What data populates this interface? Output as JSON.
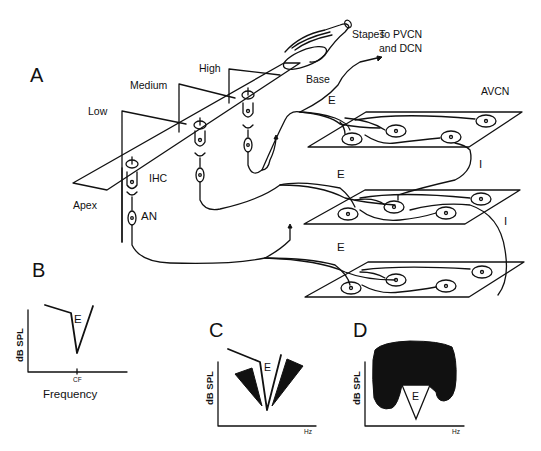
{
  "panels": {
    "A": {
      "label": "A",
      "cochlea": {
        "stapes": "Stapes",
        "base": "Base",
        "apex": "Apex",
        "frequency_regions": [
          "Low",
          "Medium",
          "High"
        ],
        "ihc": "IHC",
        "an": "AN"
      },
      "projection": "To PVCN",
      "projection_line2": "and DCN",
      "nucleus": "AVCN",
      "connection_labels": {
        "excitatory": "E",
        "inhibitory": "I"
      }
    },
    "B": {
      "label": "B",
      "ylabel": "dB SPL",
      "xtick": "CF",
      "xlabel": "Frequency",
      "region": "E"
    },
    "C": {
      "label": "C",
      "ylabel": "dB SPL",
      "xlabel": "Hz",
      "region": "E"
    },
    "D": {
      "label": "D",
      "ylabel": "dB SPL",
      "xlabel": "Hz",
      "region": "E"
    }
  }
}
